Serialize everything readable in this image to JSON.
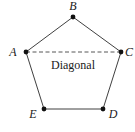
{
  "diagram": {
    "colors": {
      "stroke": "#2a2a2a",
      "dot": "#111111",
      "text": "#1a1a1a",
      "background": "#ffffff"
    },
    "vertices": [
      {
        "id": "A",
        "label": "A",
        "x": 26,
        "y": 52,
        "label_x": 13,
        "label_y": 56
      },
      {
        "id": "B",
        "label": "B",
        "x": 73,
        "y": 17,
        "label_x": 73,
        "label_y": 10
      },
      {
        "id": "C",
        "label": "C",
        "x": 121,
        "y": 52,
        "label_x": 129,
        "label_y": 56
      },
      {
        "id": "D",
        "label": "D",
        "x": 103,
        "y": 109,
        "label_x": 113,
        "label_y": 118
      },
      {
        "id": "E",
        "label": "E",
        "x": 44,
        "y": 109,
        "label_x": 33,
        "label_y": 118
      }
    ],
    "edges": [
      {
        "from": "A",
        "to": "B",
        "style": "solid"
      },
      {
        "from": "B",
        "to": "C",
        "style": "solid"
      },
      {
        "from": "C",
        "to": "D",
        "style": "solid"
      },
      {
        "from": "D",
        "to": "E",
        "style": "solid"
      },
      {
        "from": "E",
        "to": "A",
        "style": "solid"
      },
      {
        "from": "A",
        "to": "C",
        "style": "dashed"
      }
    ],
    "diagonal_label": "Diagonal",
    "diagonal_label_x": 73,
    "diagonal_label_y": 69
  }
}
